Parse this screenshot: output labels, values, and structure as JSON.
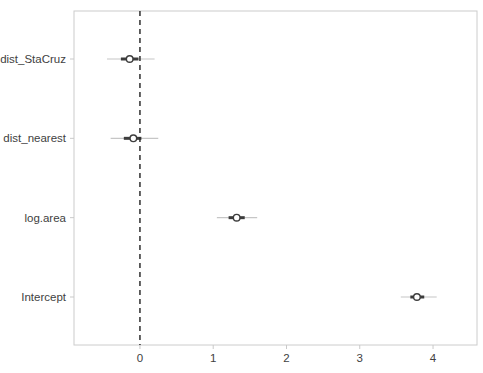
{
  "figure": {
    "background_color": "#ffffff",
    "panel_border_color": "#cccccc",
    "tick_color": "#c9c9c9",
    "text_color": "#414141",
    "outer_interval_color": "#c6c6c6",
    "inner_interval_color": "#3d3d3d",
    "point_fill_color": "#ffffff",
    "point_stroke_color": "#3d3d3d",
    "reference_line_color": "#2e2e2e"
  },
  "chart_data": {
    "type": "scatter",
    "subtype": "coefficient-interval-plot",
    "title": "",
    "xlabel": "",
    "ylabel": "",
    "orientation": "horizontal",
    "grid": false,
    "legend": false,
    "xlim": [
      -0.9,
      4.6
    ],
    "x_tick_values": [
      0,
      1,
      2,
      3,
      4
    ],
    "x_tick_labels": [
      "0",
      "1",
      "2",
      "3",
      "4"
    ],
    "reference_line_x": 0,
    "categories": [
      "dist_StaCruz",
      "dist_nearest",
      "log.area",
      "Intercept"
    ],
    "series": [
      {
        "name": "dist_StaCruz",
        "estimate": -0.14,
        "inner_interval": [
          -0.26,
          -0.02
        ],
        "outer_interval": [
          -0.45,
          0.2
        ]
      },
      {
        "name": "dist_nearest",
        "estimate": -0.09,
        "inner_interval": [
          -0.22,
          0.02
        ],
        "outer_interval": [
          -0.4,
          0.25
        ]
      },
      {
        "name": "log.area",
        "estimate": 1.32,
        "inner_interval": [
          1.21,
          1.43
        ],
        "outer_interval": [
          1.05,
          1.6
        ]
      },
      {
        "name": "Intercept",
        "estimate": 3.78,
        "inner_interval": [
          3.69,
          3.88
        ],
        "outer_interval": [
          3.56,
          4.05
        ]
      }
    ]
  }
}
